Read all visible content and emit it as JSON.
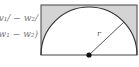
{
  "formulas": {
    "line1": "v₁/ − w₂/",
    "line2": "(w₁ − w₂)"
  },
  "diagram": {
    "radius_label": "r",
    "colors": {
      "stroke": "#333333",
      "fill_corners": "#d4d4d4",
      "background": "#ffffff",
      "center_dot": "#111111"
    },
    "shapes": {
      "rectangle": {
        "x": 41,
        "y": 5,
        "width": 96,
        "height": 50
      },
      "semicircle": {
        "cx": 89,
        "cy": 55,
        "r": 48
      },
      "radius_line": {
        "x1": 89,
        "y1": 55,
        "x2": 124,
        "y2": 22
      }
    }
  }
}
